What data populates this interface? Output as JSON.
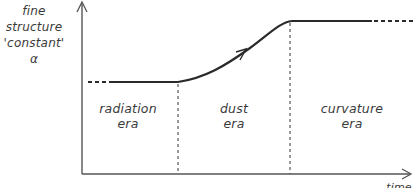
{
  "diagram": {
    "y_axis_label": {
      "line1": "fine",
      "line2": "structure",
      "line3": "'constant'",
      "line4": "α"
    },
    "x_axis_label": "time",
    "eras": [
      {
        "name": "radiation",
        "label_line1": "radiation",
        "label_line2": "era"
      },
      {
        "name": "dust",
        "label_line1": "dust",
        "label_line2": "era"
      },
      {
        "name": "curvature",
        "label_line1": "curvature",
        "label_line2": "era"
      }
    ],
    "curve_description": "alpha constant during radiation era, increases during dust era, constant again during curvature era",
    "colors": {
      "line": "#2a2a2a",
      "text": "#3a3a3a",
      "background": "#ffffff"
    }
  }
}
